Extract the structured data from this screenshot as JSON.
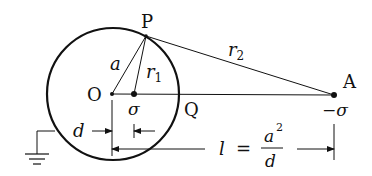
{
  "diagram": {
    "type": "method-of-images-sphere",
    "colors": {
      "stroke": "#111111",
      "background": "#ffffff"
    },
    "circle": {
      "cx": 113,
      "cy": 94,
      "r": 66
    },
    "points": {
      "O": {
        "label": "O",
        "x": 112,
        "y": 94
      },
      "sigma_in": {
        "label": "σ",
        "x": 134,
        "y": 94
      },
      "P": {
        "label": "P",
        "x": 146,
        "y": 35
      },
      "Q": {
        "label": "Q",
        "x": 179,
        "y": 94
      },
      "A": {
        "label": "A",
        "x": 334,
        "y": 95,
        "charge_label": "−σ"
      }
    },
    "segments": {
      "a": {
        "label": "a"
      },
      "r1": {
        "label": "r",
        "sub": "1"
      },
      "r2": {
        "label": "r",
        "sub": "2"
      }
    },
    "dimensions": {
      "d": {
        "label": "d"
      },
      "l": {
        "label_left": "l",
        "equals": "=",
        "num": "a",
        "num_sup": "2",
        "den": "d"
      }
    },
    "ground": {
      "symbol": "ground-icon"
    }
  }
}
